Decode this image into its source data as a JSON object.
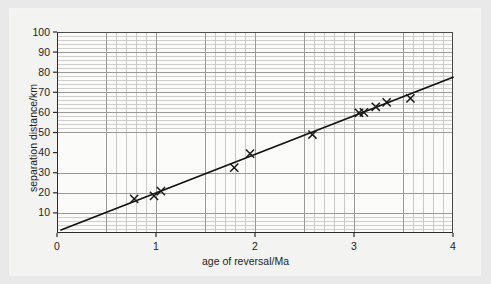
{
  "chart_data": {
    "type": "scatter",
    "title": "",
    "xlabel": "age of reversal/Ma",
    "ylabel": "separation distance/km",
    "xlim": [
      0,
      4
    ],
    "ylim": [
      0,
      100
    ],
    "xticks": [
      "0",
      "1",
      "2",
      "3",
      "4"
    ],
    "xtick_values": [
      0,
      1,
      2,
      3,
      4
    ],
    "yticks": [
      "10",
      "20",
      "30",
      "40",
      "50",
      "60",
      "70",
      "80",
      "90",
      "100"
    ],
    "ytick_values": [
      10,
      20,
      30,
      40,
      50,
      60,
      70,
      80,
      90,
      100
    ],
    "grid": "major and minor, minor x every 0.1 Ma, minor y every 2 km",
    "legend": "none",
    "marker": "x",
    "marker_color": "#1a1a1a",
    "line_color": "#111111",
    "series": [
      {
        "name": "measured reversals",
        "marker": "x",
        "points": [
          {
            "x": 0.78,
            "y": 17.0
          },
          {
            "x": 0.98,
            "y": 18.5
          },
          {
            "x": 1.05,
            "y": 20.8
          },
          {
            "x": 1.79,
            "y": 32.5
          },
          {
            "x": 1.95,
            "y": 39.5
          },
          {
            "x": 2.58,
            "y": 49.0
          },
          {
            "x": 3.05,
            "y": 59.8
          },
          {
            "x": 3.1,
            "y": 60.0
          },
          {
            "x": 3.22,
            "y": 62.8
          },
          {
            "x": 3.33,
            "y": 65.0
          },
          {
            "x": 3.57,
            "y": 67.0
          }
        ]
      },
      {
        "name": "best-fit line",
        "type": "line",
        "endpoints": [
          {
            "x": 0.04,
            "y": 1.5
          },
          {
            "x": 4.0,
            "y": 77.5
          }
        ],
        "slope_km_per_Ma": 19.2
      }
    ]
  },
  "figure": {
    "background": "#e9e9e9",
    "card_background": "#f3f3f2",
    "plot_background": "#fbfbfa",
    "axis_color": "#2b2b2b",
    "major_grid_color": "#9a9a9a",
    "minor_grid_color": "#c9c9c9"
  }
}
